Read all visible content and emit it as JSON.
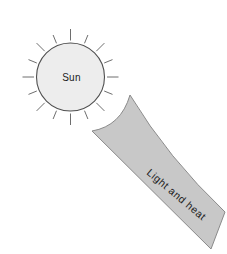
{
  "diagram": {
    "sun_label": "Sun",
    "beam_label": "Light and heat",
    "sun_ray_count": 16
  },
  "colors": {
    "background": "#ffffff",
    "sun_fill": "#ededed",
    "sun_stroke": "#4f4f4f",
    "ray_stroke": "#6e6e6e",
    "beam_fill": "#c8c8c8",
    "beam_stroke": "#8a8a8a",
    "label_color": "#1c1c1c"
  }
}
